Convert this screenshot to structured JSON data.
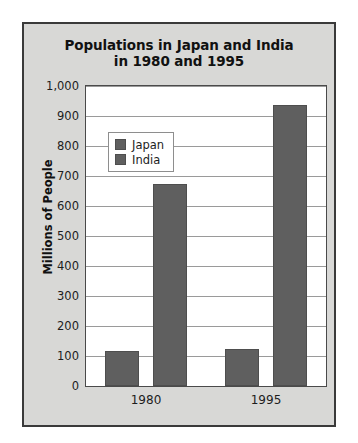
{
  "chart_data": {
    "type": "bar",
    "title": "Populations in Japan and India in 1980 and 1995",
    "title_lines": [
      "Populations in Japan and India",
      "in 1980 and 1995"
    ],
    "categories": [
      "1980",
      "1995"
    ],
    "series": [
      {
        "name": "Japan",
        "values": [
          117,
          125
        ],
        "color": "#5f5f5f"
      },
      {
        "name": "India",
        "values": [
          673,
          938
        ],
        "color": "#5f5f5f"
      }
    ],
    "xlabel": "",
    "ylabel": "Millions of People",
    "ylim": [
      0,
      1000
    ],
    "ytick_step": 100,
    "yticks": [
      0,
      100,
      200,
      300,
      400,
      500,
      600,
      700,
      800,
      900,
      1000
    ],
    "ytick_labels": [
      "0",
      "100",
      "200",
      "300",
      "400",
      "500",
      "600",
      "700",
      "800",
      "900",
      "1,000"
    ],
    "grid": true,
    "legend_position": "top-left-inside",
    "legend_entries": [
      "Japan",
      "India"
    ],
    "panel_background": "#d8d8d6",
    "plot_background": "#ffffff",
    "gridline_color": "#9a9a9a",
    "border_color": "#3a3a3a"
  }
}
